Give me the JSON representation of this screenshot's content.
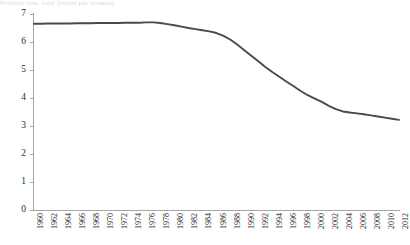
{
  "title_strip": {
    "text": "Fertility rate, total (births per woman)"
  },
  "chart_data": {
    "type": "line",
    "title": "",
    "subtitle": "",
    "xlabel": "",
    "ylabel": "",
    "grid": false,
    "legend": "none",
    "legend_entries": [],
    "annotations": [],
    "xlim": [
      1960,
      2012
    ],
    "ylim": [
      0,
      7
    ],
    "y_ticks": [
      0,
      1,
      2,
      3,
      4,
      5,
      6,
      7
    ],
    "y_tick_labels": [
      "0",
      "1",
      "2",
      "3",
      "4",
      "5",
      "6",
      "7"
    ],
    "x_tick_labels": [
      "1960",
      "1962",
      "1964",
      "1966",
      "1968",
      "1970",
      "1972",
      "1974",
      "1976",
      "1978",
      "1980",
      "1982",
      "1984",
      "1986",
      "1988",
      "1990",
      "1992",
      "1994",
      "1996",
      "1998",
      "2000",
      "2002",
      "2004",
      "2006",
      "2008",
      "2010",
      "2012"
    ],
    "series_color": "#4a4a4a",
    "axis_color": "#a6a6a6",
    "series": [
      {
        "name": "Fertility rate",
        "x": [
          1960,
          1961,
          1962,
          1963,
          1964,
          1965,
          1966,
          1967,
          1968,
          1969,
          1970,
          1971,
          1972,
          1973,
          1974,
          1975,
          1976,
          1977,
          1978,
          1979,
          1980,
          1981,
          1982,
          1983,
          1984,
          1985,
          1986,
          1987,
          1988,
          1989,
          1990,
          1991,
          1992,
          1993,
          1994,
          1995,
          1996,
          1997,
          1998,
          1999,
          2000,
          2001,
          2002,
          2003,
          2004,
          2005,
          2006,
          2007,
          2008,
          2009,
          2010,
          2011,
          2012
        ],
        "values": [
          6.65,
          6.65,
          6.66,
          6.66,
          6.66,
          6.66,
          6.67,
          6.67,
          6.67,
          6.68,
          6.68,
          6.68,
          6.68,
          6.69,
          6.69,
          6.69,
          6.7,
          6.7,
          6.68,
          6.64,
          6.6,
          6.55,
          6.5,
          6.46,
          6.42,
          6.38,
          6.32,
          6.22,
          6.08,
          5.9,
          5.7,
          5.5,
          5.3,
          5.1,
          4.92,
          4.75,
          4.58,
          4.42,
          4.25,
          4.1,
          3.98,
          3.86,
          3.72,
          3.6,
          3.52,
          3.48,
          3.45,
          3.42,
          3.38,
          3.34,
          3.3,
          3.26,
          3.22
        ]
      }
    ]
  }
}
